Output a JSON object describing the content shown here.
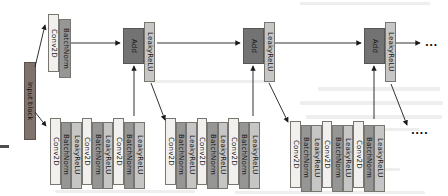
{
  "colors": {
    "conv": "#f2f0ee",
    "batchnorm": "#969696",
    "leakyrelu": "#c6c6c6",
    "add": "#737373",
    "input": "#80736d",
    "arrow": "#1b1b1b"
  },
  "input_block": {
    "label": "Input block"
  },
  "top_branch": {
    "conv_label": "Conv2D",
    "bn_label": "BatchNorm"
  },
  "merges": [
    {
      "add_label": "Add",
      "relu_label": "LeakyReLU"
    },
    {
      "add_label": "Add",
      "relu_label": "LeakyReLU"
    },
    {
      "add_label": "Add",
      "relu_label": "LeakyReLU"
    }
  ],
  "stacks": [
    {
      "blocks": [
        "Conv2D",
        "BatchNorm",
        "LeakyReLU",
        "Conv2D",
        "BatchNorm",
        "LeakyReLU",
        "Conv2D",
        "BatchNorm",
        "LeakyReLU"
      ]
    },
    {
      "blocks": [
        "Conv2D",
        "BatchNorm",
        "LeakyReLU",
        "Conv2D",
        "BatchNorm",
        "LeakyReLU",
        "Conv2D",
        "BatchNorm",
        "LeakyReLU"
      ]
    },
    {
      "blocks": [
        "Conv2D",
        "BatchNorm",
        "LeakyReLU",
        "Conv2D",
        "BatchNorm",
        "LeakyReLU",
        "Conv2D",
        "BatchNorm",
        "LeakyReLU"
      ]
    }
  ],
  "ellipsis": {
    "right": "...",
    "bottom_right": "...."
  }
}
